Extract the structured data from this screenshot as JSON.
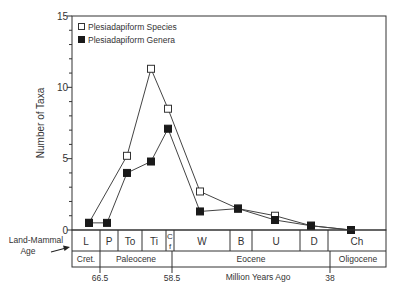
{
  "chart_data": {
    "type": "line",
    "title": "",
    "xlabel": "Million Years Ago",
    "ylabel": "Number of Taxa",
    "ylim": [
      0,
      15
    ],
    "yticks_major": [
      0,
      5,
      10,
      15
    ],
    "yticks_minor_step": 1,
    "grid": false,
    "legend_position": "upper left (inside)",
    "categories": [
      "L",
      "P",
      "To",
      "Ti",
      "Cf",
      "W",
      "B",
      "U",
      "D",
      "Ch"
    ],
    "series": [
      {
        "name": "Plesiadapiform Species",
        "marker": "open-square",
        "points": [
          {
            "age": "L",
            "value": 0.5
          },
          {
            "age": "To",
            "value": 5.2
          },
          {
            "age": "Ti",
            "value": 11.3
          },
          {
            "age": "Cf",
            "value": 8.5
          },
          {
            "age": "W",
            "value": 2.7
          },
          {
            "age": "B",
            "value": 1.5
          },
          {
            "age": "U",
            "value": 1.0
          },
          {
            "age": "D",
            "value": 0.3
          },
          {
            "age": "Ch",
            "value": 0.0
          }
        ]
      },
      {
        "name": "Plesiadapiform Genera",
        "marker": "filled-square",
        "points": [
          {
            "age": "L",
            "value": 0.5
          },
          {
            "age": "P",
            "value": 0.5
          },
          {
            "age": "To",
            "value": 4.0
          },
          {
            "age": "Ti",
            "value": 4.8
          },
          {
            "age": "Cf",
            "value": 7.1
          },
          {
            "age": "W",
            "value": 1.3
          },
          {
            "age": "B",
            "value": 1.5
          },
          {
            "age": "U",
            "value": 0.7
          },
          {
            "age": "D",
            "value": 0.3
          },
          {
            "age": "Ch",
            "value": 0.0
          }
        ]
      }
    ],
    "land_mammal_age_label": [
      "Land-Mammal",
      "Age"
    ],
    "land_mammal_ages": [
      {
        "label": "L",
        "x0": 72,
        "x1": 100
      },
      {
        "label": "P",
        "x0": 100,
        "x1": 118
      },
      {
        "label": "To",
        "x0": 118,
        "x1": 142
      },
      {
        "label": "Ti",
        "x0": 142,
        "x1": 166
      },
      {
        "label": "C",
        "label2": "f",
        "x0": 166,
        "x1": 174
      },
      {
        "label": "W",
        "x0": 174,
        "x1": 230
      },
      {
        "label": "B",
        "x0": 230,
        "x1": 252
      },
      {
        "label": "U",
        "x0": 252,
        "x1": 300
      },
      {
        "label": "D",
        "x0": 300,
        "x1": 328
      },
      {
        "label": "Ch",
        "x0": 328,
        "x1": 386
      }
    ],
    "epochs": [
      {
        "label": "Cret.",
        "x0": 72,
        "x1": 100
      },
      {
        "label": "Paleocene",
        "x0": 100,
        "x1": 172
      },
      {
        "label": "Eocene",
        "x0": 172,
        "x1": 330
      },
      {
        "label": "Oligocene",
        "x0": 330,
        "x1": 386
      }
    ],
    "time_ticks": [
      {
        "label": "66.5",
        "x": 100
      },
      {
        "label": "58.5",
        "x": 172
      },
      {
        "label": "38",
        "x": 330
      }
    ],
    "colors": {
      "line": "#444444",
      "open_fill": "#ffffff",
      "filled": "#1a1a1a",
      "axis": "#333333"
    }
  },
  "legend": {
    "species": "Plesiadapiform Species",
    "genera": "Plesiadapiform Genera"
  },
  "axis": {
    "ylabel": "Number of Taxa",
    "xlabel": "Million Years Ago",
    "y0": "0",
    "y5": "5",
    "y10": "10",
    "y15": "15"
  },
  "lma_label": {
    "line1": "Land-Mammal",
    "line2": "Age"
  }
}
